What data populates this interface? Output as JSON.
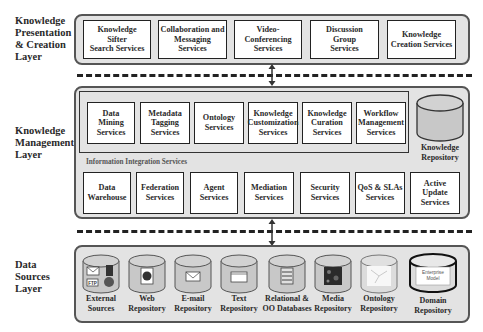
{
  "layers": {
    "presentation": {
      "label": "Knowledge Presentation & Creation Layer",
      "label_lines": [
        "Knowledge",
        "Presentation",
        "& Creation",
        "Layer"
      ],
      "services": [
        {
          "lines": [
            "Knowledge",
            "Sifter",
            "Search Services"
          ]
        },
        {
          "lines": [
            "Collaboration and",
            "Messaging",
            "Services"
          ]
        },
        {
          "lines": [
            "Video-",
            "Conferencing",
            "Services"
          ]
        },
        {
          "lines": [
            "Discussion",
            "Group",
            "Services"
          ]
        },
        {
          "lines": [
            "Knowledge",
            "Creation Services"
          ]
        }
      ]
    },
    "management": {
      "label": "Knowledge Management Layer",
      "label_lines": [
        "Knowledge",
        "Management",
        "Layer"
      ],
      "top_services": [
        {
          "lines": [
            "Data",
            "Mining",
            "Services"
          ]
        },
        {
          "lines": [
            "Metadata",
            "Tagging",
            "Services"
          ]
        },
        {
          "lines": [
            "Ontology",
            "Services"
          ]
        },
        {
          "lines": [
            "Knowledge",
            "Customization",
            "Services"
          ]
        },
        {
          "lines": [
            "Knowledge",
            "Curation",
            "Services"
          ]
        },
        {
          "lines": [
            "Workflow",
            "Management",
            "Services"
          ]
        }
      ],
      "repository": {
        "lines": [
          "Knowledge",
          "Repository"
        ]
      },
      "integration_group_label": "Information Integration Services",
      "integration_services": [
        {
          "lines": [
            "Data",
            "Warehouse"
          ]
        },
        {
          "lines": [
            "Federation",
            "Services"
          ]
        },
        {
          "lines": [
            "Agent",
            "Services"
          ]
        },
        {
          "lines": [
            "Mediation",
            "Services"
          ]
        },
        {
          "lines": [
            "Security",
            "Services"
          ]
        },
        {
          "lines": [
            "QoS & SLAs",
            "Services"
          ]
        },
        {
          "lines": [
            "Active",
            "Update",
            "Services"
          ]
        }
      ]
    },
    "data_sources": {
      "label": "Data Sources Layer",
      "label_lines": [
        "Data",
        "Sources",
        "Layer"
      ],
      "repositories": [
        {
          "lines": [
            "External",
            "Sources"
          ],
          "icon": "external-sources-icon"
        },
        {
          "lines": [
            "Web",
            "Repository"
          ],
          "icon": "web-page-icon"
        },
        {
          "lines": [
            "E-mail",
            "Repository"
          ],
          "icon": "envelope-icon"
        },
        {
          "lines": [
            "Text",
            "Repository"
          ],
          "icon": "text-document-icon"
        },
        {
          "lines": [
            "Relational &",
            "OO Databases"
          ],
          "icon": "database-table-icon"
        },
        {
          "lines": [
            "Media",
            "Repository"
          ],
          "icon": "media-image-icon"
        },
        {
          "lines": [
            "Ontology",
            "Repository"
          ],
          "icon": "ontology-graph-icon"
        },
        {
          "lines": [
            "Domain",
            "Repository"
          ],
          "icon": "enterprise-model-icon",
          "inner_text": [
            "Enterprise",
            "Model"
          ]
        }
      ]
    }
  },
  "colors": {
    "layer_fill": "#e3e3e3",
    "box_fill": "#ffffff",
    "border": "#222222",
    "cylinder_fill": "#c8c8c8"
  }
}
